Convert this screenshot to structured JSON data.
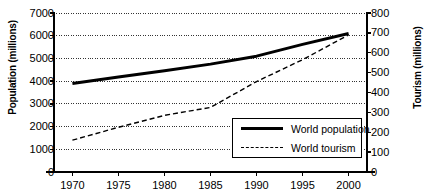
{
  "chart_data": {
    "type": "line",
    "title": "",
    "subtitle": "",
    "xlabel": "",
    "ylabel": "Population (millions)",
    "y2label": "Tourism (millions)",
    "grid": true,
    "legend_position": "inside-lower-right",
    "x": [
      1970,
      1975,
      1980,
      1985,
      1990,
      1995,
      2000
    ],
    "xtick_labels": [
      "1970",
      "1975",
      "1980",
      "1985",
      "1990",
      "1995",
      "2000"
    ],
    "xlim": [
      1968,
      2002
    ],
    "ylim": [
      0,
      7000
    ],
    "ytick_labels": [
      "0",
      "1000",
      "2000",
      "3000",
      "4000",
      "5000",
      "6000",
      "7000"
    ],
    "yticks": [
      0,
      1000,
      2000,
      3000,
      4000,
      5000,
      6000,
      7000
    ],
    "y2lim": [
      0,
      800
    ],
    "y2tick_labels": [
      "0",
      "100",
      "200",
      "300",
      "400",
      "500",
      "600",
      "700",
      "800"
    ],
    "y2ticks": [
      0,
      100,
      200,
      300,
      400,
      500,
      600,
      700,
      800
    ],
    "series": [
      {
        "name": "World population",
        "axis": "left",
        "style": "solid",
        "width": 3,
        "color": "#000000",
        "x": [
          1970,
          1975,
          1980,
          1985,
          1990,
          1995,
          2000
        ],
        "values": [
          3900,
          4180,
          4460,
          4750,
          5100,
          5620,
          6100
        ]
      },
      {
        "name": "World tourism",
        "axis": "right",
        "style": "dashed",
        "width": 1.4,
        "color": "#000000",
        "x": [
          1970,
          1975,
          1980,
          1985,
          1990,
          1995,
          2000
        ],
        "values": [
          160,
          225,
          285,
          325,
          455,
          565,
          690
        ]
      }
    ],
    "legend": [
      "World population",
      "World tourism"
    ]
  },
  "legend": {
    "items": [
      {
        "label": "World population",
        "swatch": "solid-line-swatch"
      },
      {
        "label": "World tourism",
        "swatch": "dashed-line-swatch"
      }
    ]
  }
}
